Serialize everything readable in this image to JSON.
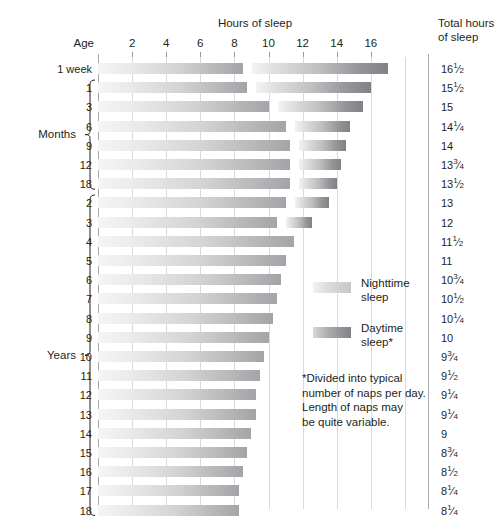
{
  "header": {
    "hours_title": "Hours of sleep",
    "age_label": "Age",
    "total_title": "Total hours\nof sleep"
  },
  "groups": {
    "months_label": "Months",
    "years_label": "Years"
  },
  "legend": {
    "nighttime_label": "Nighttime\nsleep",
    "daytime_label": "Daytime\nsleep*"
  },
  "footnote": "*Divided into typical\nnumber of naps per day.\nLength of naps may\nbe quite variable.",
  "chart_data": {
    "type": "bar",
    "title": "Hours of sleep",
    "xlabel": "Hours of sleep",
    "ylabel": "Age",
    "xlim": [
      0,
      18
    ],
    "ticks": [
      2,
      4,
      6,
      8,
      10,
      12,
      14,
      16
    ],
    "grid": true,
    "legend_position": "inside-right",
    "stacked": "segmented-with-gap",
    "series": [
      {
        "name": "Nighttime sleep",
        "color": "#c4c6c8"
      },
      {
        "name": "Daytime sleep",
        "color": "#808285"
      }
    ],
    "categories": [
      "1 week",
      "1",
      "3",
      "6",
      "9",
      "12",
      "18",
      "2",
      "3",
      "4",
      "5",
      "6",
      "7",
      "8",
      "9",
      "10",
      "11",
      "12",
      "13",
      "14",
      "15",
      "16",
      "17",
      "18"
    ],
    "rows": [
      {
        "age": "1 week",
        "group": "week",
        "night": 8.5,
        "day": 8.0,
        "total": "16",
        "total_frac": "1/2",
        "total_value": 16.5
      },
      {
        "age": "1",
        "group": "months",
        "night": 8.75,
        "day": 6.75,
        "total": "15",
        "total_frac": "1/2",
        "total_value": 15.5
      },
      {
        "age": "3",
        "group": "months",
        "night": 10.0,
        "day": 5.0,
        "total": "15",
        "total_frac": "",
        "total_value": 15
      },
      {
        "age": "6",
        "group": "months",
        "night": 11.0,
        "day": 3.25,
        "total": "14",
        "total_frac": "1/4",
        "total_value": 14.25
      },
      {
        "age": "9",
        "group": "months",
        "night": 11.25,
        "day": 2.75,
        "total": "14",
        "total_frac": "",
        "total_value": 14
      },
      {
        "age": "12",
        "group": "months",
        "night": 11.25,
        "day": 2.5,
        "total": "13",
        "total_frac": "3/4",
        "total_value": 13.75
      },
      {
        "age": "18",
        "group": "months",
        "night": 11.25,
        "day": 2.25,
        "total": "13",
        "total_frac": "1/2",
        "total_value": 13.5
      },
      {
        "age": "2",
        "group": "years",
        "night": 11.0,
        "day": 2.0,
        "total": "13",
        "total_frac": "",
        "total_value": 13
      },
      {
        "age": "3",
        "group": "years",
        "night": 10.5,
        "day": 1.5,
        "total": "12",
        "total_frac": "",
        "total_value": 12
      },
      {
        "age": "4",
        "group": "years",
        "night": 11.5,
        "day": 0,
        "total": "11",
        "total_frac": "1/2",
        "total_value": 11.5
      },
      {
        "age": "5",
        "group": "years",
        "night": 11.0,
        "day": 0,
        "total": "11",
        "total_frac": "",
        "total_value": 11
      },
      {
        "age": "6",
        "group": "years",
        "night": 10.75,
        "day": 0,
        "total": "10",
        "total_frac": "3/4",
        "total_value": 10.75
      },
      {
        "age": "7",
        "group": "years",
        "night": 10.5,
        "day": 0,
        "total": "10",
        "total_frac": "1/2",
        "total_value": 10.5
      },
      {
        "age": "8",
        "group": "years",
        "night": 10.25,
        "day": 0,
        "total": "10",
        "total_frac": "1/4",
        "total_value": 10.25
      },
      {
        "age": "9",
        "group": "years",
        "night": 10.0,
        "day": 0,
        "total": "10",
        "total_frac": "",
        "total_value": 10
      },
      {
        "age": "10",
        "group": "years",
        "night": 9.75,
        "day": 0,
        "total": "9",
        "total_frac": "3/4",
        "total_value": 9.75
      },
      {
        "age": "11",
        "group": "years",
        "night": 9.5,
        "day": 0,
        "total": "9",
        "total_frac": "1/2",
        "total_value": 9.5
      },
      {
        "age": "12",
        "group": "years",
        "night": 9.25,
        "day": 0,
        "total": "9",
        "total_frac": "1/4",
        "total_value": 9.25
      },
      {
        "age": "13",
        "group": "years",
        "night": 9.25,
        "day": 0,
        "total": "9",
        "total_frac": "1/4",
        "total_value": 9.25
      },
      {
        "age": "14",
        "group": "years",
        "night": 9.0,
        "day": 0,
        "total": "9",
        "total_frac": "",
        "total_value": 9
      },
      {
        "age": "15",
        "group": "years",
        "night": 8.75,
        "day": 0,
        "total": "8",
        "total_frac": "3/4",
        "total_value": 8.75
      },
      {
        "age": "16",
        "group": "years",
        "night": 8.5,
        "day": 0,
        "total": "8",
        "total_frac": "1/2",
        "total_value": 8.5
      },
      {
        "age": "17",
        "group": "years",
        "night": 8.25,
        "day": 0,
        "total": "8",
        "total_frac": "1/4",
        "total_value": 8.25
      },
      {
        "age": "18",
        "group": "years",
        "night": 8.25,
        "day": 0,
        "total": "8",
        "total_frac": "1/4",
        "total_value": 8.25
      }
    ]
  }
}
